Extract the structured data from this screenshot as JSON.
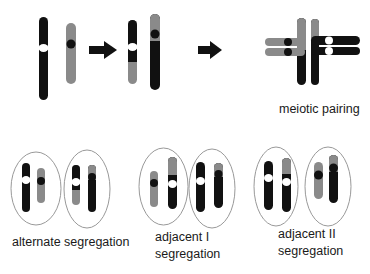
{
  "colors": {
    "black": "#111111",
    "gray": "#8a8a8a",
    "white": "#ffffff",
    "outline": "#999999"
  },
  "labels": {
    "meiotic_pairing": "meiotic pairing",
    "alternate": "alternate segregation",
    "adjacent1_line1": "adjacent I",
    "adjacent1_line2": "segregation",
    "adjacent2_line1": "adjacent II",
    "adjacent2_line2": "segregation"
  },
  "stages": [
    {
      "name": "normal-chromosomes",
      "description": "two non-homologous chromosomes"
    },
    {
      "name": "translocated-chromosomes",
      "description": "reciprocal translocation products"
    },
    {
      "name": "meiotic-pairing",
      "description": "quadrivalent cross-shaped pairing"
    }
  ],
  "segregation_types": [
    "alternate segregation",
    "adjacent I segregation",
    "adjacent II segregation"
  ]
}
